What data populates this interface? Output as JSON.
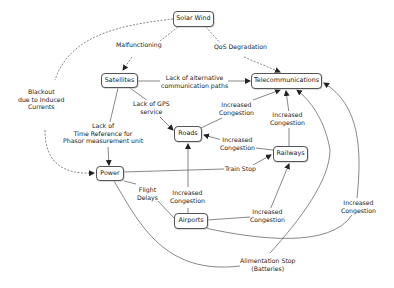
{
  "nodes": {
    "solar_wind": "Solar Wind",
    "satellites": "Satellites",
    "telecommunications": "Telecommunications",
    "roads": "Roads",
    "railways": "Railways",
    "power": "Power",
    "airports": "Airports"
  },
  "edge_labels": {
    "malfunctioning": "Malfunctioning",
    "qos_degradation": "QoS Degradation",
    "blackout_1": "Blackout",
    "blackout_2": "due to Induced",
    "blackout_3": "Currents",
    "lack_alt_1": "Lack of alternative",
    "lack_alt_2": "communication paths",
    "lack_gps_1": "Lack of GPS",
    "lack_gps_2": "service",
    "lack_time_1": "Lack of",
    "lack_time_2": "Time Reference for",
    "lack_time_3": "Phasor measurement unit",
    "roads_telecom_1": "Increased",
    "roads_telecom_2": "Congestion",
    "rail_telecom_1": "Increased",
    "rail_telecom_2": "Congestion",
    "rail_roads_1": "Increased",
    "rail_roads_2": "Congestion",
    "train_stop": "Train Stop",
    "flight_delays_1": "Flight",
    "flight_delays_2": "Delays",
    "air_roads_1": "Increased",
    "air_roads_2": "Congestion",
    "air_rail_1": "Increased",
    "air_rail_2": "Congestion",
    "air_telecom_1": "Increased",
    "air_telecom_2": "Congestion",
    "alim_1": "Alimentation Stop",
    "alim_2": "(Batteries)"
  }
}
